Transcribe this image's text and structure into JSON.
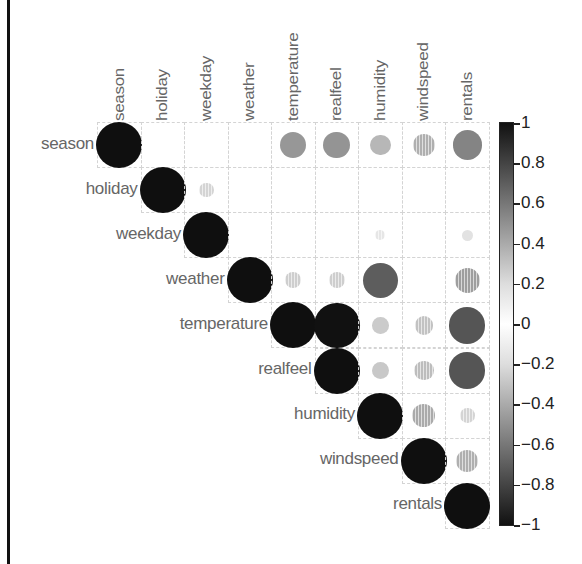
{
  "chart_data": {
    "type": "heatmap",
    "subtype": "correlation-circle-upper",
    "title": "",
    "variables": [
      "season",
      "holiday",
      "weekday",
      "weather",
      "temperature",
      "realfeel",
      "humidity",
      "windspeed",
      "rentals"
    ],
    "matrix": [
      [
        1.0,
        0.01,
        0.0,
        0.02,
        0.33,
        0.34,
        0.2,
        -0.23,
        0.41
      ],
      [
        0.01,
        1.0,
        -0.1,
        -0.03,
        -0.03,
        -0.03,
        -0.02,
        0.01,
        -0.01
      ],
      [
        0.0,
        -0.1,
        1.0,
        0.03,
        0.0,
        -0.01,
        -0.05,
        0.01,
        0.06
      ],
      [
        0.02,
        -0.03,
        0.03,
        1.0,
        -0.12,
        -0.12,
        0.59,
        0.04,
        -0.3
      ],
      [
        0.33,
        -0.03,
        0.0,
        -0.12,
        1.0,
        0.99,
        0.13,
        -0.16,
        0.63
      ],
      [
        0.34,
        -0.03,
        -0.01,
        -0.12,
        0.99,
        1.0,
        0.14,
        -0.18,
        0.63
      ],
      [
        0.2,
        -0.02,
        -0.05,
        0.59,
        0.13,
        0.14,
        1.0,
        -0.25,
        -0.1
      ],
      [
        -0.23,
        0.01,
        0.01,
        0.04,
        -0.16,
        -0.18,
        -0.25,
        1.0,
        -0.23
      ],
      [
        0.41,
        -0.01,
        0.06,
        -0.3,
        0.63,
        0.63,
        -0.1,
        -0.23,
        1.0
      ]
    ],
    "display": "upper triangle including diagonal; circle size and shade proportional to |r|; negative values shown with vertical stripes",
    "colorbar": {
      "min": -1,
      "max": 1,
      "ticks": [
        "1",
        "0.8",
        "0.6",
        "0.4",
        "0.2",
        "0",
        "−0.2",
        "−0.4",
        "−0.6",
        "−0.8",
        "−1"
      ],
      "position": "right"
    },
    "grid": true,
    "colors": {
      "strong": "#111111",
      "weak": "#ffffff",
      "grid": "#d4d4d4",
      "label": "#666666"
    }
  }
}
